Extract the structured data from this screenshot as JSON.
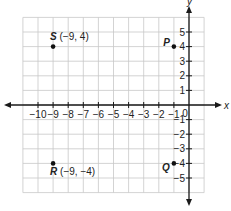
{
  "axes": {
    "x_label": "x",
    "y_label": "y",
    "origin_label": "0",
    "x_min": -11,
    "x_max": 1,
    "y_min": -6,
    "y_max": 6,
    "x_ticks": [
      -10,
      -9,
      -8,
      -7,
      -6,
      -5,
      -4,
      -3,
      -2,
      -1
    ],
    "x_tick_labels": [
      "−10",
      "−9",
      "−8",
      "−7",
      "−6",
      "−5",
      "−4",
      "−3",
      "−2",
      "−1"
    ],
    "y_ticks": [
      5,
      4,
      3,
      2,
      1,
      -1,
      -2,
      -3,
      -4,
      -5
    ],
    "y_tick_labels": [
      "5",
      "4",
      "3",
      "2",
      "1",
      "−1",
      "−2",
      "−3",
      "−4",
      "−5"
    ]
  },
  "points": [
    {
      "name": "S",
      "x": -9,
      "y": 4,
      "coord_text": "(−9, 4)",
      "label_position": "above"
    },
    {
      "name": "R",
      "x": -9,
      "y": -4,
      "coord_text": "(−9, −4)",
      "label_position": "below"
    },
    {
      "name": "P",
      "x": -1,
      "y": 4,
      "coord_text": "",
      "label_position": "left"
    },
    {
      "name": "Q",
      "x": -1,
      "y": -4,
      "coord_text": "",
      "label_position": "below-left"
    }
  ],
  "colors": {
    "grid": "#c8c8c8",
    "axis": "#1a1a1a",
    "point": "#111111",
    "text": "#222222"
  }
}
